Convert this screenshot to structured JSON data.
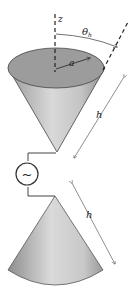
{
  "diagram": {
    "labels": {
      "z_axis": "z",
      "half_angle": "θ",
      "half_angle_subscript": "h",
      "radius": "a",
      "height_top": "h",
      "height_bottom": "h",
      "source_symbol": "~"
    },
    "components": [
      {
        "name": "top-cone",
        "type": "cone",
        "orientation": "apex-down"
      },
      {
        "name": "bottom-cone",
        "type": "cone",
        "orientation": "apex-up"
      },
      {
        "name": "ac-source",
        "type": "voltage-source"
      },
      {
        "name": "z-axis",
        "type": "dashed-line"
      },
      {
        "name": "cone-edge-extension",
        "type": "dashed-line"
      }
    ],
    "colors": {
      "cone_fill_light": "#d8d8d8",
      "cone_fill_dark": "#8f8f8f",
      "disk_fill": "#9a9a9a",
      "line": "#333333"
    }
  }
}
